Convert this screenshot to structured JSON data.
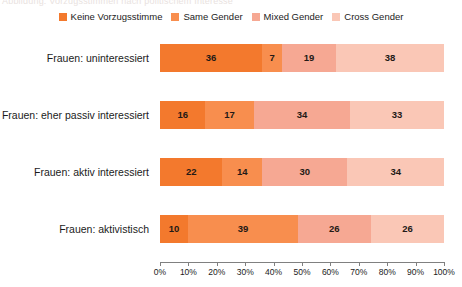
{
  "top_caption_sliver": "Abbildung: Vorzugsstimmen nach politischem Interesse",
  "legend": {
    "position": "top-center",
    "items": [
      {
        "label": "Keine Vorzugsstimme",
        "color": "#F3792D",
        "icon": "square-swatch-icon"
      },
      {
        "label": "Same Gender",
        "color": "#F88E4E",
        "icon": "square-swatch-icon"
      },
      {
        "label": "Mixed Gender",
        "color": "#F6A893",
        "icon": "square-swatch-icon"
      },
      {
        "label": "Cross Gender",
        "color": "#FAC7B6",
        "icon": "square-swatch-icon"
      }
    ]
  },
  "axis": {
    "ticks": [
      "0%",
      "10%",
      "20%",
      "30%",
      "40%",
      "50%",
      "60%",
      "70%",
      "80%",
      "90%",
      "100%"
    ],
    "min": 0,
    "max": 100
  },
  "chart_data": {
    "type": "bar",
    "orientation": "horizontal",
    "stacked": true,
    "stack_total": 100,
    "title": "",
    "subtitle": "",
    "xlabel": "",
    "ylabel": "",
    "xlim": [
      0,
      100
    ],
    "grid": false,
    "legend_position": "top-center",
    "value_suffix": "%",
    "categories": [
      "Frauen: uninteressiert",
      "Frauen: eher passiv interessiert",
      "Frauen: aktiv interessiert",
      "Frauen: aktivistisch"
    ],
    "series": [
      {
        "name": "Keine Vorzugsstimme",
        "color": "#F3792D",
        "values": [
          36,
          16,
          22,
          10
        ]
      },
      {
        "name": "Same Gender",
        "color": "#F88E4E",
        "values": [
          7,
          17,
          14,
          39
        ]
      },
      {
        "name": "Mixed Gender",
        "color": "#F6A893",
        "values": [
          19,
          34,
          30,
          26
        ]
      },
      {
        "name": "Cross Gender",
        "color": "#FAC7B6",
        "values": [
          38,
          33,
          34,
          26
        ]
      }
    ],
    "rows": [
      {
        "category": "Frauen: uninteressiert",
        "values": [
          36,
          7,
          19,
          38
        ]
      },
      {
        "category": "Frauen: eher passiv interessiert",
        "values": [
          16,
          17,
          34,
          33
        ]
      },
      {
        "category": "Frauen: aktiv interessiert",
        "values": [
          22,
          14,
          30,
          34
        ]
      },
      {
        "category": "Frauen: aktivistisch",
        "values": [
          10,
          39,
          26,
          26
        ]
      }
    ]
  }
}
